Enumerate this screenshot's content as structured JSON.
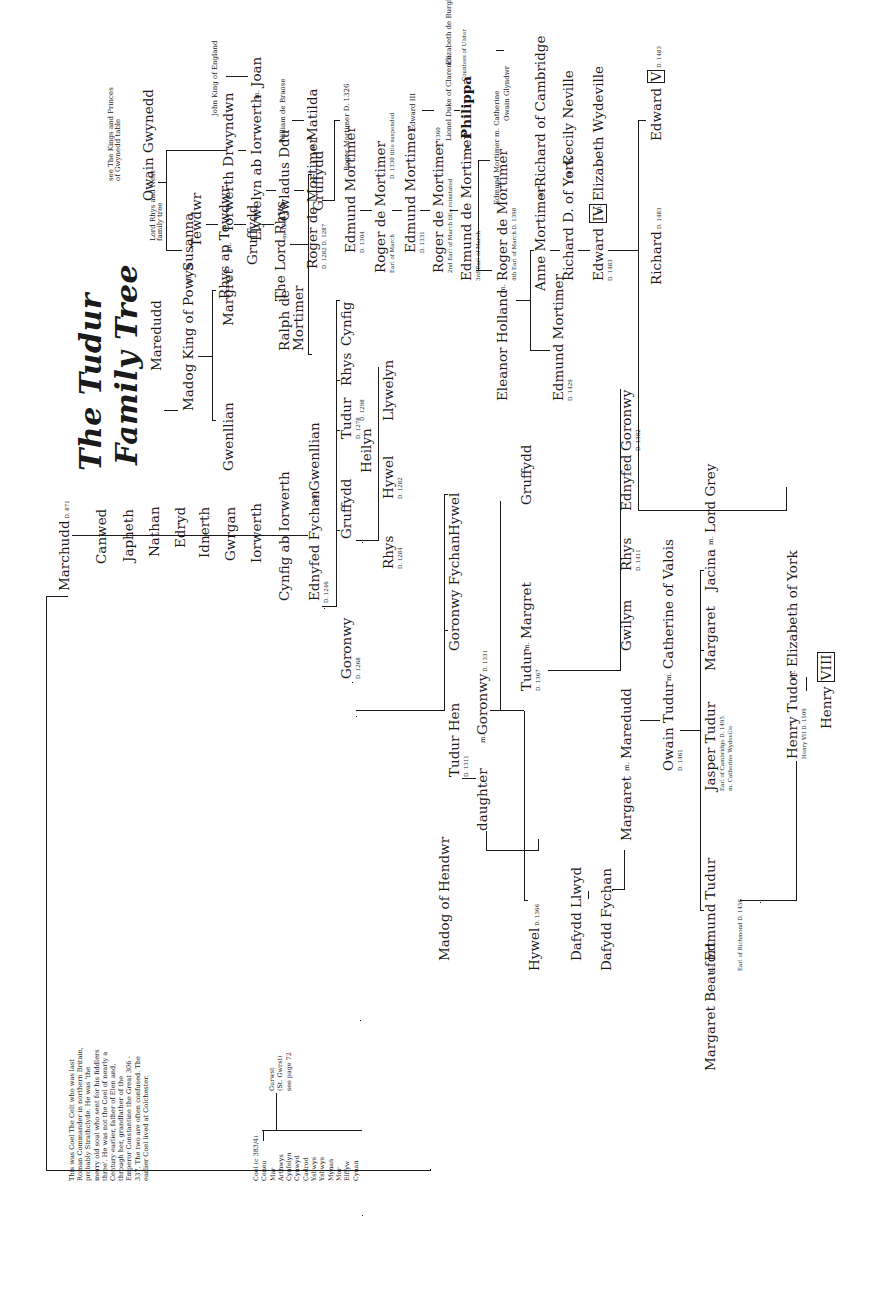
{
  "title": {
    "line1": "The Tudur",
    "line2": "Family Tree"
  },
  "notes": {
    "coel_note": "This was Coel The Celt who was last Roman Commander in northern Britain, probably Strathclyde. He was 'the merry old soul who sent for his fiddlers three'. He was not the Coel of nearly a Century earlier, father of Elen and, through her, grandfather of the Emperor Constantine the Great 306 - 337. The two are often confused. The earlier Coel lived at Colchester.",
    "coel_line": [
      "Coel (c 383/4)",
      "Ceneu",
      "Mar",
      "Arthwys",
      "Cynfelyn",
      "Cynwyd",
      "Cadrod",
      "Ysbwys",
      "Ysbwys",
      "Mynan",
      "Mor",
      "Elffyw",
      "Cynan"
    ],
    "gurwst_branch": [
      "Gurwst",
      "(St. Gwrst)",
      "see page 72"
    ],
    "lord_rhys_ref": [
      "Lord Rhys and Nest",
      "family tree"
    ],
    "gwynedd_ref": [
      "see The Kings and Princes",
      "of Gwynedd table"
    ]
  },
  "marriage_symbol": "m.",
  "people": {
    "marchudd": {
      "name": "Marchudd",
      "info": "D. 871"
    },
    "cenwed": {
      "name": "Canwed"
    },
    "japheth": {
      "name": "Japheth"
    },
    "nathan": {
      "name": "Nathan"
    },
    "edryd": {
      "name": "Edryd"
    },
    "idnerth": {
      "name": "Idnerth"
    },
    "gwrgan": {
      "name": "Gwrgan"
    },
    "iorwerth": {
      "name": "Iorwerth"
    },
    "cynfig": {
      "name": "Cynfig ab Iorwerth"
    },
    "ednyfed_fychan": {
      "name": "Ednyfed Fychan",
      "info": "D. 1246"
    },
    "gwenllian_1": {
      "name": "Gwenllian"
    },
    "goronwy_1268": {
      "name": "Goronwy",
      "info": "D. 1268"
    },
    "gruffydd_a": {
      "name": "Gruffydd"
    },
    "tudur_1278": {
      "name": "Tudur",
      "info": "D. 1278"
    },
    "heilyn": {
      "name": "Heilyn",
      "info": "D. 1298"
    },
    "rhys_a": {
      "name": "Rhys"
    },
    "cynfig_b": {
      "name": "Cynfig"
    },
    "rhys_1284": {
      "name": "Rhys",
      "info": "D. 1284"
    },
    "hywel_1282": {
      "name": "Hywel",
      "info": "D. 1282"
    },
    "llywelyn_b": {
      "name": "Llywelyn"
    },
    "tudur_hen": {
      "name": "Tudur Hen",
      "info": "D. 1311"
    },
    "goronwy_fychan": {
      "name": "Goronwy Fychan"
    },
    "hywel_b": {
      "name": "Hywel"
    },
    "goronwy_1331": {
      "name": "Goronwy",
      "info": "D. 1331"
    },
    "daughter": {
      "name": "daughter"
    },
    "madog_hendwr": {
      "name": "Madog of Hendwr"
    },
    "tudur_1367": {
      "name": "Tudur",
      "info": "D. 1367"
    },
    "margret_b": {
      "name": "Margret"
    },
    "gruffydd_c": {
      "name": "Gruffydd"
    },
    "hywel_1366": {
      "name": "Hywel",
      "info": "D. 1366"
    },
    "dafydd_llwyd": {
      "name": "Dafydd Llwyd"
    },
    "dafydd_fychan": {
      "name": "Dafydd Fychan"
    },
    "margaret_a": {
      "name": "Margaret"
    },
    "maredudd_b": {
      "name": "Maredudd"
    },
    "gwilym": {
      "name": "Gwilym"
    },
    "rhys_1411": {
      "name": "Rhys",
      "info": "D. 1411"
    },
    "ednyfed_b": {
      "name": "Ednyfed"
    },
    "goronwy_1382": {
      "name": "Goronwy",
      "info": "D. 1382"
    },
    "owain_tudur": {
      "name": "Owain Tudur",
      "info": "D. 1461"
    },
    "catherine_valois": {
      "name": "Catherine of Valois"
    },
    "jasper_tudur": {
      "name": "Jasper Tudur",
      "info": "Earl of Cambridge D. 1495",
      "spouse": "m. Catherine Wydeville"
    },
    "margaret_c": {
      "name": "Margaret"
    },
    "jacina": {
      "name": "Jacina"
    },
    "lord_grey": {
      "name": "Lord Grey"
    },
    "edmund_tudur": {
      "name": "Edmund Tudur",
      "info": "Earl of Richmond D. 1456"
    },
    "margaret_beaufort": {
      "name": "Margaret Beaufort"
    },
    "henry_tudor": {
      "name": "Henry Tudor",
      "info": "Henry VII D. 1509"
    },
    "elizabeth_york": {
      "name": "Elizabeth of York"
    },
    "henry_viii": {
      "name": "Henry",
      "regnal": "VIII"
    },
    "tewdwr": {
      "name": "Tewdwr"
    },
    "rhys_ap_tewdwr": {
      "name": "Rhys ap Tewdwr"
    },
    "gruffydd_r": {
      "name": "Gruffydd"
    },
    "lord_rhys": {
      "name": "The Lord Rhys"
    },
    "gwenllian_2": {
      "name": "Gwenllian"
    },
    "gruffydd_s": {
      "name": "Gruffydd"
    },
    "maredudd_a": {
      "name": "Maredudd"
    },
    "madog_powys": {
      "name": "Madog King of Powys"
    },
    "susanna": {
      "name": "Susanna"
    },
    "owain_gwynedd": {
      "name": "Owain Gwynedd"
    },
    "gwenllian_3": {
      "name": "Gwenllian"
    },
    "margret_a": {
      "name": "Margret"
    },
    "iorwerth_drwyndwn": {
      "name": "Iorwerth Drwyndwn"
    },
    "llywelyn_ab_iorwerth": {
      "name": "Llywelyn ab Iorwerth"
    },
    "joan": {
      "name": "Joan"
    },
    "john_king": {
      "name": "John King of England"
    },
    "ralph_mortimer": {
      "name": "Ralph de Mortimer",
      "info": "m. 1230"
    },
    "gwladus_ddu": {
      "name": "Gwladus Ddu"
    },
    "roger_1282": {
      "name": "Roger de Mortimer",
      "info": "D. 1282 D. 1287"
    },
    "matilda": {
      "name": "Matilda"
    },
    "william_braose": {
      "name": "William de Braose"
    },
    "edmund_1304": {
      "name": "Edmund Mortimer",
      "info": "D. 1304"
    },
    "roger_1326": {
      "name": "Roger Mortimer D. 1326"
    },
    "roger_1330": {
      "name": "Roger de Mortimer",
      "info": "Earl of March",
      "note": "D. 1330 title suspended"
    },
    "edmund_1331": {
      "name": "Edmund Mortimer",
      "info": "D. 1331"
    },
    "edward_iii": {
      "name": "Edward III"
    },
    "roger_2nd": {
      "name": "Roger de Mortimer",
      "info": "2nd Earl of March title reinstated",
      "note": "D. 1360"
    },
    "lionel": {
      "name": "Lionel Duke of Clarence"
    },
    "elizabeth_burgh": {
      "name": "Elizabeth de Burgh"
    },
    "edmund_3rd": {
      "name": "Edmund de Mortimer",
      "info": "3rd Earl of March"
    },
    "philippa": {
      "name": "Philippa",
      "info": "Countess of Ulster"
    },
    "eleanor_holland": {
      "name": "Eleanor Holland"
    },
    "roger_4th": {
      "name": "Roger de Mortimer",
      "info": "4th Earl of March D. 1398"
    },
    "owain_glyndwr": {
      "name": "Owain Glyndwr"
    },
    "edmund_catherine": {
      "name": "Edmund Mortimer m. Catherine"
    },
    "edmund_1429": {
      "name": "Edmund Mortimer",
      "info": "D. 1429"
    },
    "anne_mortimer": {
      "name": "Anne Mortimer"
    },
    "richard_cambridge": {
      "name": "Richard of Cambridge"
    },
    "richard_york": {
      "name": "Richard D. of York"
    },
    "cecily_neville": {
      "name": "Cecily Neville"
    },
    "edward_iv": {
      "name": "Edward",
      "regnal": "IV",
      "info": "D. 1483"
    },
    "elizabeth_wydeville": {
      "name": "Elizabeth Wydeville"
    },
    "richard_1483": {
      "name": "Richard",
      "info": "D. 1483"
    },
    "edward_v": {
      "name": "Edward",
      "regnal": "V",
      "info": "D. 1483"
    }
  }
}
